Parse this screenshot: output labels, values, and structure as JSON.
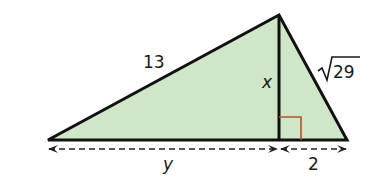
{
  "diagram": {
    "type": "right-triangle-altitude",
    "colors": {
      "fill": "#cfe6c8",
      "stroke": "#111111",
      "right_angle_marker": "#b5532e",
      "dimension_line": "#222222",
      "background": "#ffffff"
    },
    "vertices": {
      "left": [
        48,
        140
      ],
      "apex": [
        279,
        15
      ],
      "right": [
        347,
        140
      ],
      "foot": [
        279,
        140
      ]
    },
    "labels": {
      "hypotenuse_left": "13",
      "altitude": "x",
      "hypotenuse_right_radical": "√",
      "hypotenuse_right_value": "29",
      "base_left": "y",
      "base_right": "2"
    }
  }
}
